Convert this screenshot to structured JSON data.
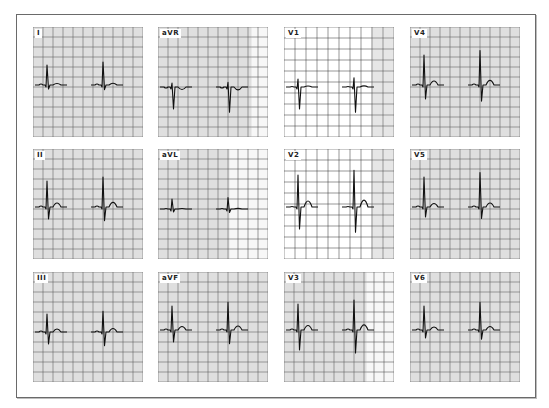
{
  "figure": {
    "leads": [
      {
        "id": "I",
        "label": "I",
        "row": 0,
        "col": 0,
        "grid": "dense",
        "washout": 0
      },
      {
        "id": "aVR",
        "label": "aVR",
        "row": 0,
        "col": 1,
        "grid": "dense",
        "washout": 0.15
      },
      {
        "id": "V1",
        "label": "V1",
        "row": 0,
        "col": 2,
        "grid": "sparse",
        "washout": 0.8
      },
      {
        "id": "V4",
        "label": "V4",
        "row": 0,
        "col": 3,
        "grid": "dense",
        "washout": 0
      },
      {
        "id": "II",
        "label": "II",
        "row": 1,
        "col": 0,
        "grid": "dense",
        "washout": 0
      },
      {
        "id": "aVL",
        "label": "aVL",
        "row": 1,
        "col": 1,
        "grid": "dense",
        "washout": 0.35
      },
      {
        "id": "V2",
        "label": "V2",
        "row": 1,
        "col": 2,
        "grid": "sparse",
        "washout": 0.8
      },
      {
        "id": "V5",
        "label": "V5",
        "row": 1,
        "col": 3,
        "grid": "dense",
        "washout": 0
      },
      {
        "id": "III",
        "label": "III",
        "row": 2,
        "col": 0,
        "grid": "dense",
        "washout": 0
      },
      {
        "id": "aVF",
        "label": "aVF",
        "row": 2,
        "col": 1,
        "grid": "dense",
        "washout": 0
      },
      {
        "id": "V3",
        "label": "V3",
        "row": 2,
        "col": 2,
        "grid": "dense",
        "washout": 0.25
      },
      {
        "id": "V6",
        "label": "V6",
        "row": 2,
        "col": 3,
        "grid": "dense",
        "washout": 0
      }
    ],
    "layout": {
      "col_x": [
        33,
        158,
        284,
        410
      ],
      "row_y": [
        27,
        149,
        272
      ],
      "panel_size": 110
    },
    "colors": {
      "major_grid": "#3a3a3a",
      "minor_grid": "#9a9a9a",
      "trace": "#111111",
      "paper": "#f4f4f4",
      "frame": "#6a6a6a"
    }
  }
}
